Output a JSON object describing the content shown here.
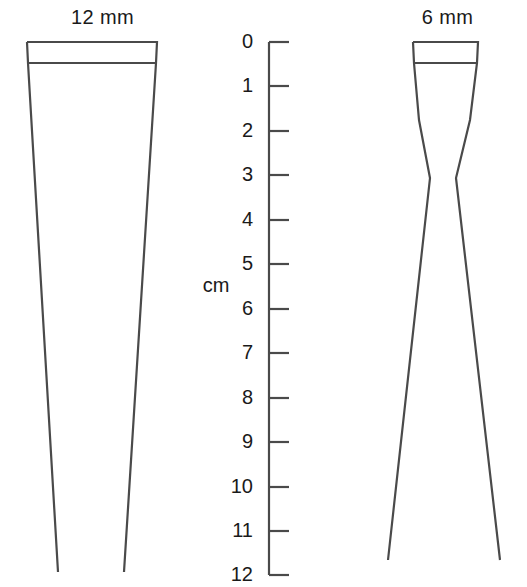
{
  "figure": {
    "background_color": "#ffffff",
    "stroke_color": "#4a4a4a",
    "text_color": "#1a1a1a"
  },
  "left_instrument": {
    "caption": "12 mm",
    "name": "tapered-blade-12mm"
  },
  "right_instrument": {
    "caption": "6 mm",
    "name": "waisted-blade-6mm"
  },
  "ruler": {
    "unit_label": "cm",
    "min": 0,
    "max": 12,
    "tick_labels": [
      "0",
      "1",
      "2",
      "3",
      "4",
      "5",
      "6",
      "7",
      "8",
      "9",
      "10",
      "11",
      "12"
    ],
    "tick_values": [
      0,
      1,
      2,
      3,
      4,
      5,
      6,
      7,
      8,
      9,
      10,
      11,
      12
    ]
  }
}
